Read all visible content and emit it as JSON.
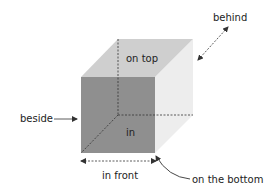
{
  "diagram": {
    "type": "prepositions-of-place cube",
    "labels": {
      "on_top": "on top",
      "in": "in",
      "behind": "behind",
      "beside": "beside",
      "in_front": "in front",
      "on_the_bottom": "on the bottom"
    },
    "colors": {
      "front_face": "#8f8f8f",
      "top_face": "#cfcfcf",
      "right_face": "#ededed",
      "dashes": "#333333",
      "text": "#222222"
    }
  }
}
